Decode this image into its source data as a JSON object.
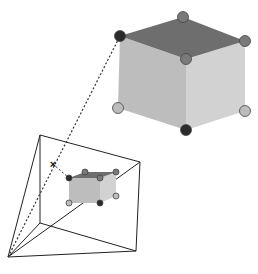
{
  "diagram": {
    "colors": {
      "background": "#ffffff",
      "cube_top": "#6e6e6e",
      "cube_left": "#bdbdbd",
      "cube_right": "#d2d2d2",
      "edge_line": "#222222",
      "dotted_ray": "#333333",
      "vertex_dark": "#2b2b2b",
      "vertex_mid": "#7a7a7a",
      "vertex_light": "#bcbcbc"
    },
    "big_cube": {
      "vertices": {
        "top_left": [
          120,
          36
        ],
        "top_back": [
          183,
          17
        ],
        "top_right": [
          245,
          41
        ],
        "top_front": [
          186,
          59
        ],
        "bottom_left": [
          118,
          108
        ],
        "bottom_front": [
          186,
          130
        ],
        "bottom_right": [
          245,
          111
        ]
      },
      "vertex_markers": [
        {
          "name": "top-left",
          "x": 120,
          "y": 36,
          "shade": "dark"
        },
        {
          "name": "top-back",
          "x": 183,
          "y": 17,
          "shade": "mid"
        },
        {
          "name": "top-right",
          "x": 245,
          "y": 41,
          "shade": "mid"
        },
        {
          "name": "top-front",
          "x": 186,
          "y": 59,
          "shade": "mid"
        },
        {
          "name": "bottom-left",
          "x": 118,
          "y": 108,
          "shade": "light"
        },
        {
          "name": "bottom-front",
          "x": 186,
          "y": 130,
          "shade": "dark"
        },
        {
          "name": "bottom-right",
          "x": 245,
          "y": 111,
          "shade": "light"
        }
      ]
    },
    "frustum": {
      "apex": [
        8,
        257
      ],
      "near_plane": {
        "top_left": [
          40,
          135
        ],
        "top_right": [
          140,
          162
        ],
        "bottom_right": [
          136,
          251
        ],
        "bottom_left": [
          40,
          223
        ]
      }
    },
    "small_cube": {
      "vertices": {
        "top_left": [
          69,
          178
        ],
        "top_back": [
          85,
          172
        ],
        "top_right": [
          116,
          172
        ],
        "top_front": [
          100,
          178
        ],
        "bottom_left": [
          69,
          203
        ],
        "bottom_front": [
          100,
          203
        ],
        "bottom_right": [
          116,
          196
        ]
      },
      "vertex_markers": [
        {
          "name": "top-left",
          "x": 69,
          "y": 178,
          "shade": "dark"
        },
        {
          "name": "top-back",
          "x": 85,
          "y": 172,
          "shade": "mid"
        },
        {
          "name": "top-right",
          "x": 116,
          "y": 172,
          "shade": "mid"
        },
        {
          "name": "top-front",
          "x": 100,
          "y": 178,
          "shade": "mid"
        },
        {
          "name": "bottom-left",
          "x": 69,
          "y": 203,
          "shade": "light"
        },
        {
          "name": "bottom-front",
          "x": 100,
          "y": 203,
          "shade": "dark"
        },
        {
          "name": "bottom-right",
          "x": 116,
          "y": 196,
          "shade": "light"
        }
      ]
    },
    "projection_ray": {
      "from": [
        8,
        257
      ],
      "to": [
        120,
        36
      ]
    },
    "intersection_mark": {
      "x": 53,
      "y": 164,
      "symbol": "×"
    },
    "dashed_connector": {
      "from": [
        53,
        164
      ],
      "to": [
        69,
        178
      ]
    }
  }
}
